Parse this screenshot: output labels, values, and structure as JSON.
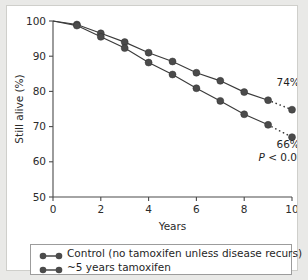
{
  "chart_data": {
    "type": "line",
    "title": "",
    "xlabel": "Years",
    "ylabel": "Still alive (%)",
    "xlim": [
      0,
      10
    ],
    "ylim": [
      50,
      100
    ],
    "xticks": [
      "0",
      "2",
      "4",
      "6",
      "8",
      "10"
    ],
    "xtick_values": [
      0,
      2,
      4,
      6,
      8,
      10
    ],
    "yticks": [
      "50",
      "60",
      "70",
      "80",
      "90",
      "100"
    ],
    "ytick_values": [
      50,
      60,
      70,
      80,
      90,
      100
    ],
    "grid": false,
    "legend_position": "below-axes",
    "x": [
      0,
      1,
      2,
      3,
      4,
      5,
      6,
      7,
      8,
      9,
      10
    ],
    "series": [
      {
        "name": "~5 years tamoxifen",
        "values": [
          100,
          99.0,
          96.5,
          94.0,
          91.0,
          88.5,
          85.3,
          83.0,
          79.8,
          77.5,
          74.8
        ],
        "dotted_from_x": 9,
        "end_label": "74%",
        "color": "#3a3a3a"
      },
      {
        "name": "Control (no tamoxifen unless disease recurs)",
        "values": [
          100,
          98.7,
          95.5,
          92.3,
          88.2,
          84.8,
          80.9,
          77.3,
          73.5,
          70.5,
          67.0
        ],
        "dotted_from_x": 9,
        "end_label": "66%",
        "color": "#3a3a3a"
      }
    ],
    "annotations": [
      {
        "text": "74%",
        "x": 9.35,
        "y": 81.5
      },
      {
        "text": "66%",
        "x": 9.35,
        "y": 64.0
      },
      {
        "text_prefix": "P",
        "text_rest": " < 0.00001",
        "x": 8.6,
        "y": 60.3
      }
    ]
  },
  "legend": {
    "items": [
      {
        "label": "Control (no tamoxifen unless disease recurs)"
      },
      {
        "label": "~5 years tamoxifen"
      }
    ]
  },
  "axes": {
    "x_title": "Years",
    "y_title": "Still alive (%)"
  },
  "colors": {
    "line": "#3a3a3a",
    "marker": "#4b4b4b",
    "axis": "#4a4a4a",
    "panel_background": "#ffffff",
    "figure_background": "#e9e9e7",
    "text": "#1f1f1f"
  }
}
